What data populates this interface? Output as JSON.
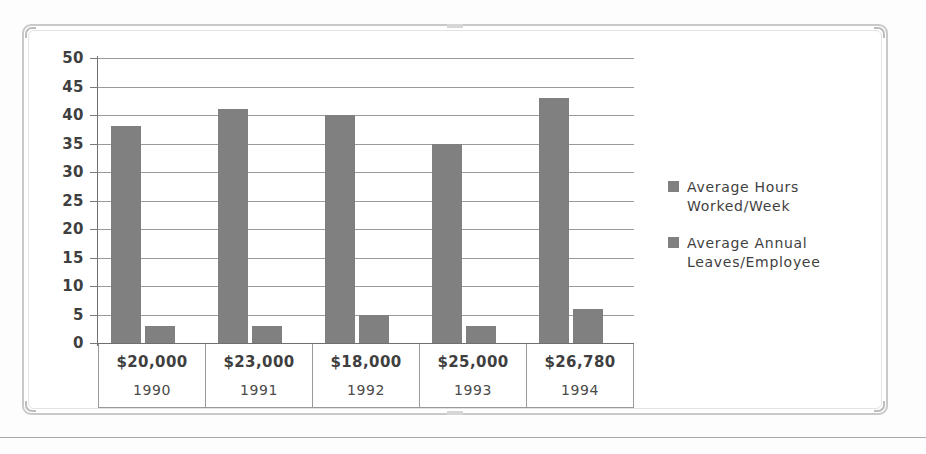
{
  "chart_data": {
    "type": "bar",
    "title": "",
    "xlabel": "",
    "ylabel": "",
    "ylim": [
      0,
      50
    ],
    "ytick_step": 5,
    "yticks": [
      50,
      45,
      40,
      35,
      30,
      25,
      20,
      15,
      10,
      5,
      0
    ],
    "grid": true,
    "legend_position": "right",
    "categories": [
      "1990",
      "1991",
      "1992",
      "1993",
      "1994"
    ],
    "category_secondary_label": [
      "$20,000",
      "$23,000",
      "$18,000",
      "$25,000",
      "$26,780"
    ],
    "series": [
      {
        "name": "Average Hours Worked/Week",
        "values": [
          38,
          41,
          40,
          35,
          43
        ],
        "color": "#808080"
      },
      {
        "name": "Average Annual Leaves/Employee",
        "values": [
          3,
          3,
          5,
          3,
          6
        ],
        "color": "#808080"
      }
    ]
  },
  "legend": {
    "items": [
      {
        "label": "Average Hours\nWorked/Week",
        "color": "#808080"
      },
      {
        "label": "Average Annual\nLeaves/Employee",
        "color": "#808080"
      }
    ]
  },
  "style": {
    "bar_color": "#808080",
    "gridline_color": "#9a9a9a",
    "axis_color": "#6f6f6f",
    "frame_color": "#c9c9c9",
    "text_color": "#3f3f3f",
    "background": "#ffffff"
  }
}
